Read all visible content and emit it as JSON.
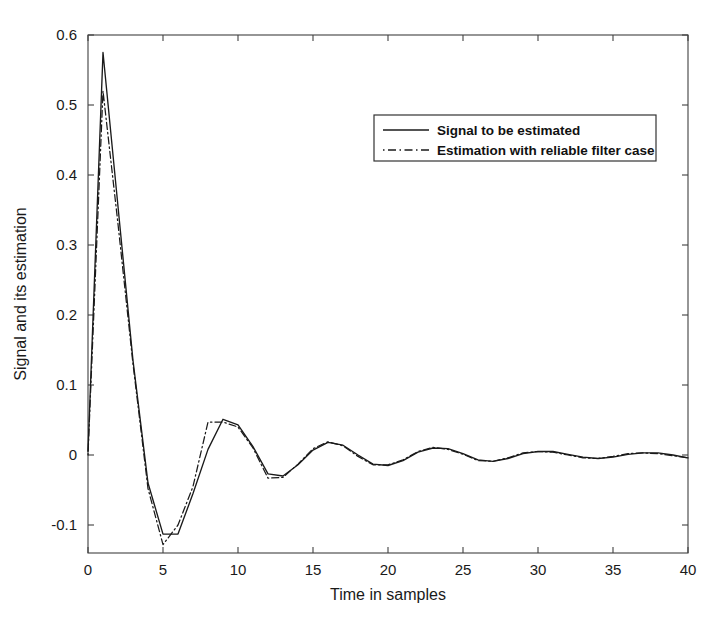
{
  "figure": {
    "background": "#ffffff",
    "foreground": "#1a1a1a"
  },
  "axes": {
    "x_title": "Time in samples",
    "y_title": "Signal and its estimation",
    "x_ticks": [
      "0",
      "5",
      "10",
      "15",
      "20",
      "25",
      "30",
      "35",
      "40"
    ],
    "y_ticks": [
      "0.6",
      "0.5",
      "0.4",
      "0.3",
      "0.2",
      "0.1",
      "0",
      "-0.1"
    ]
  },
  "legend": {
    "entries": [
      {
        "label": "Signal to be estimated",
        "style": "solid"
      },
      {
        "label": "Estimation with reliable filter case",
        "style": "dash-dot"
      }
    ]
  },
  "chart_data": {
    "type": "line",
    "title": "",
    "xlabel": "Time in samples",
    "ylabel": "Signal and its estimation",
    "xlim": [
      0,
      40
    ],
    "ylim": [
      -0.14,
      0.6
    ],
    "xticks": [
      0,
      5,
      10,
      15,
      20,
      25,
      30,
      35,
      40
    ],
    "yticks": [
      -0.1,
      0,
      0.1,
      0.2,
      0.3,
      0.4,
      0.5,
      0.6
    ],
    "grid": false,
    "legend_position": "upper right",
    "x": [
      0,
      1,
      2,
      3,
      4,
      5,
      6,
      7,
      8,
      9,
      10,
      11,
      12,
      13,
      14,
      15,
      16,
      17,
      18,
      19,
      20,
      21,
      22,
      23,
      24,
      25,
      26,
      27,
      28,
      29,
      30,
      31,
      32,
      33,
      34,
      35,
      36,
      37,
      38,
      39,
      40
    ],
    "series": [
      {
        "name": "Signal to be estimated",
        "style": "solid",
        "color": "#1a1a1a",
        "values": [
          0.005,
          0.575,
          0.355,
          0.135,
          -0.04,
          -0.113,
          -0.113,
          -0.055,
          0.008,
          0.051,
          0.043,
          0.012,
          -0.027,
          -0.03,
          -0.014,
          0.007,
          0.018,
          0.014,
          0.0,
          -0.013,
          -0.015,
          -0.008,
          0.004,
          0.01,
          0.009,
          0.002,
          -0.007,
          -0.009,
          -0.005,
          0.002,
          0.005,
          0.005,
          0.001,
          -0.003,
          -0.005,
          -0.003,
          0.001,
          0.003,
          0.003,
          0.0,
          -0.004
        ]
      },
      {
        "name": "Estimation with reliable filter case",
        "style": "dash-dot",
        "color": "#1a1a1a",
        "values": [
          0.0,
          0.52,
          0.33,
          0.13,
          -0.048,
          -0.128,
          -0.1,
          -0.045,
          0.047,
          0.047,
          0.04,
          0.01,
          -0.033,
          -0.032,
          -0.013,
          0.009,
          0.019,
          0.013,
          -0.002,
          -0.014,
          -0.014,
          -0.007,
          0.005,
          0.011,
          0.008,
          0.001,
          -0.008,
          -0.009,
          -0.004,
          0.003,
          0.005,
          0.004,
          0.0,
          -0.004,
          -0.005,
          -0.002,
          0.002,
          0.003,
          0.002,
          -0.001,
          -0.004
        ]
      }
    ]
  }
}
